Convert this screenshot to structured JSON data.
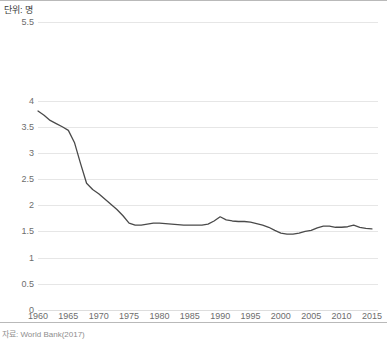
{
  "unit_label": "단위: 명",
  "source_note": "자료: World Bank(2017)",
  "style": {
    "line_color": "#4a4a4a",
    "grid_color": "#e6e6e6",
    "tick_text_color": "#6d6d6d",
    "background": "#ffffff",
    "frame_color": "#b9b9b9"
  },
  "chart_data": {
    "type": "line",
    "title": "",
    "subtitle": "",
    "xlabel": "",
    "ylabel": "단위: 명",
    "grid": true,
    "legend": false,
    "legend_position": "none",
    "xlim": [
      1960,
      2016
    ],
    "ylim": [
      0,
      5.5
    ],
    "ytick_labels": [
      "0",
      "0.5",
      "1",
      "1.5",
      "2",
      "2.5",
      "3",
      "3.5",
      "4",
      "5.5"
    ],
    "yticks": [
      0,
      0.5,
      1,
      1.5,
      2,
      2.5,
      3,
      3.5,
      4,
      5.5
    ],
    "xticks": [
      1960,
      1965,
      1970,
      1975,
      1980,
      1985,
      1990,
      1995,
      2000,
      2005,
      2010,
      2015
    ],
    "xtick_labels": [
      "1960",
      "1965",
      "1970",
      "1975",
      "1980",
      "1985",
      "1990",
      "1995",
      "2000",
      "2005",
      "2010",
      "2015"
    ],
    "series": [
      {
        "name": "합계출산율",
        "color": "#4a4a4a",
        "x": [
          1960,
          1961,
          1962,
          1963,
          1964,
          1965,
          1966,
          1967,
          1968,
          1969,
          1970,
          1971,
          1972,
          1973,
          1974,
          1975,
          1976,
          1977,
          1978,
          1979,
          1980,
          1981,
          1982,
          1983,
          1984,
          1985,
          1986,
          1987,
          1988,
          1989,
          1990,
          1991,
          1992,
          1993,
          1994,
          1995,
          1996,
          1997,
          1998,
          1999,
          2000,
          2001,
          2002,
          2003,
          2004,
          2005,
          2006,
          2007,
          2008,
          2009,
          2010,
          2011,
          2012,
          2013,
          2014,
          2015
        ],
        "values": [
          3.8,
          3.72,
          3.62,
          3.56,
          3.5,
          3.43,
          3.2,
          2.8,
          2.42,
          2.3,
          2.22,
          2.12,
          2.02,
          1.92,
          1.8,
          1.66,
          1.62,
          1.62,
          1.64,
          1.66,
          1.66,
          1.65,
          1.64,
          1.63,
          1.62,
          1.62,
          1.62,
          1.62,
          1.64,
          1.7,
          1.78,
          1.72,
          1.7,
          1.69,
          1.69,
          1.68,
          1.65,
          1.62,
          1.58,
          1.52,
          1.47,
          1.45,
          1.45,
          1.47,
          1.5,
          1.52,
          1.57,
          1.6,
          1.6,
          1.58,
          1.58,
          1.59,
          1.62,
          1.58,
          1.56,
          1.55
        ]
      }
    ]
  }
}
